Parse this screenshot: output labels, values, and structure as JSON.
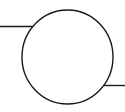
{
  "diagram": {
    "type": "circuit-symbol",
    "symbol": "circle-with-two-leads",
    "stroke_color": "#1a1a1a",
    "background_color": "#ffffff",
    "elements": [
      {
        "name": "left-lead",
        "kind": "wire"
      },
      {
        "name": "circle-body",
        "kind": "component-outline"
      },
      {
        "name": "right-lead",
        "kind": "wire"
      }
    ]
  }
}
